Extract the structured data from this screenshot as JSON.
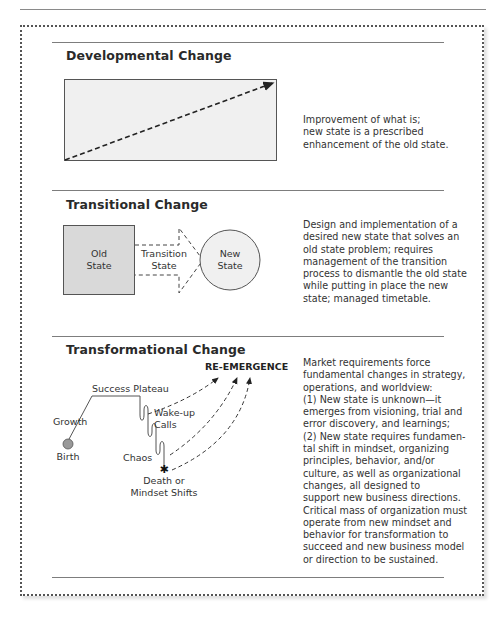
{
  "figure": {
    "frame_style": "dotted border",
    "sections": [
      {
        "title": "Developmental Change",
        "description": "Improvement of what is;\nnew state is a prescribed\nenhancement of the old state."
      },
      {
        "title": "Transitional Change",
        "description": "Design and implementation of a\ndesired new state that solves an\nold state problem; requires\nmanagement of the transition\nprocess to dismantle the old state\nwhile putting in place the new\nstate; managed timetable.",
        "labels": {
          "old_state_1": "Old",
          "old_state_2": "State",
          "transition_1": "Transition",
          "transition_2": "State",
          "new_state_1": "New",
          "new_state_2": "State"
        }
      },
      {
        "title": "Transformational Change",
        "description": "Market requirements force\nfundamental changes in strategy,\noperations, and worldview:\n(1) New state is unknown—it\nemerges from visioning, trial and\nerror discovery, and learnings;\n(2) New state requires fundamen-\ntal shift in mindset, organizing\nprinciples, behavior, and/or\nculture, as well as organizational\nchanges, all designed to\nsupport new business directions.\nCritical mass of organization must\noperate from new mindset and\nbehavior for transformation to\nsucceed and new business model\nor direction to be sustained.",
        "labels": {
          "re_emergence": "RE-EMERGENCE",
          "success_plateau": "Success Plateau",
          "growth": "Growth",
          "wake_up_1": "Wake-up",
          "wake_up_2": "Calls",
          "chaos": "Chaos",
          "birth": "Birth",
          "death_1": "Death or",
          "death_2": "Mindset Shifts"
        }
      }
    ],
    "colors": {
      "box_fill": "#efefef",
      "old_state_fill": "#d8d8d8",
      "line": "#333333",
      "rule": "#7d7d7d"
    }
  }
}
